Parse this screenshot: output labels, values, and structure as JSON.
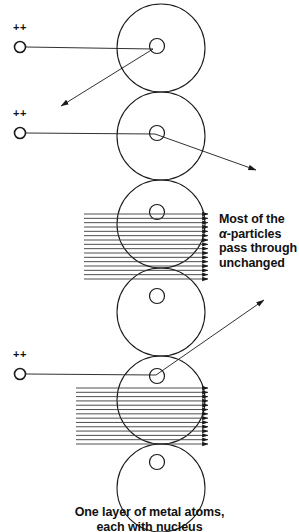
{
  "figure": {
    "caption_line1": "One layer of metal atoms,",
    "caption_line2": "each with nucleus",
    "most_label_line1": "Most of the",
    "most_label_alpha": "α",
    "most_label_line2_rest": "-particles",
    "most_label_line3": "pass through",
    "most_label_line4": "unchanged",
    "alpha_charge_symbol": "++",
    "colors": {
      "stroke": "#1a1a1a",
      "beam": "#3a3a3a",
      "background": "#ffffff",
      "text": "#111111"
    }
  },
  "atoms": [
    {
      "id": "atom-1",
      "cx": 161,
      "cy": 48,
      "r": 44,
      "nucleus_r": 7.5,
      "nucleus_cx": 157,
      "nucleus_cy": 46
    },
    {
      "id": "atom-2",
      "cx": 161,
      "cy": 136,
      "r": 44,
      "nucleus_r": 7.5,
      "nucleus_cx": 157,
      "nucleus_cy": 133
    },
    {
      "id": "atom-3",
      "cx": 161,
      "cy": 224,
      "r": 44,
      "nucleus_r": 7.5,
      "nucleus_cx": 157,
      "nucleus_cy": 212
    },
    {
      "id": "atom-4",
      "cx": 161,
      "cy": 312,
      "r": 44,
      "nucleus_r": 7.5,
      "nucleus_cx": 157,
      "nucleus_cy": 296
    },
    {
      "id": "atom-5",
      "cx": 161,
      "cy": 400,
      "r": 44,
      "nucleus_r": 7.5,
      "nucleus_cx": 157,
      "nucleus_cy": 376
    },
    {
      "id": "atom-6",
      "cx": 161,
      "cy": 488,
      "r": 44,
      "nucleus_r": 7.5,
      "nucleus_cx": 157,
      "nucleus_cy": 462
    }
  ],
  "alpha_particles": [
    {
      "id": "alpha-1",
      "x": 20,
      "y": 47,
      "r": 5.5,
      "plus_x": 13,
      "plus_y": 31
    },
    {
      "id": "alpha-2",
      "x": 20,
      "y": 133,
      "r": 5.5,
      "plus_x": 13,
      "plus_y": 117
    },
    {
      "id": "alpha-3",
      "x": 20,
      "y": 374,
      "r": 5.5,
      "plus_x": 13,
      "plus_y": 358
    }
  ],
  "scatter_tracks": [
    {
      "id": "track-1",
      "deflection": "back-scattered",
      "in_from_x": 26,
      "in_from_y": 47,
      "nucleus_x": 153,
      "nucleus_y": 49,
      "out_to_x": 61,
      "out_to_y": 106
    },
    {
      "id": "track-2",
      "deflection": "small-angle",
      "in_from_x": 26,
      "in_from_y": 133,
      "nucleus_x": 155,
      "nucleus_y": 134,
      "out_to_x": 256,
      "out_to_y": 170
    },
    {
      "id": "track-3",
      "deflection": "up-right",
      "in_from_x": 26,
      "in_from_y": 374,
      "nucleus_x": 156,
      "nucleus_y": 375,
      "out_to_x": 264,
      "out_to_y": 300
    }
  ],
  "beams": [
    {
      "id": "beam-upper",
      "x_start": 84,
      "x_end": 208,
      "y_top": 214,
      "y_bottom": 279,
      "count": 16
    },
    {
      "id": "beam-lower",
      "x_start": 76,
      "x_end": 208,
      "y_top": 388,
      "y_bottom": 444,
      "count": 14
    }
  ]
}
